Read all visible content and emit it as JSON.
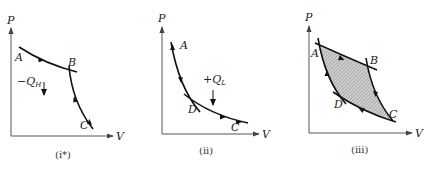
{
  "figure": {
    "panels": [
      {
        "id": "i*",
        "caption": "(i*)",
        "axis_y_label": "P",
        "axis_x_label": "V",
        "points": [
          "A",
          "B",
          "C"
        ],
        "heat_label": "−Q",
        "heat_sub": "H",
        "description": "Isothermal compression A-B (upper) and adiabatic B-C"
      },
      {
        "id": "ii",
        "caption": "(ii)",
        "axis_y_label": "P",
        "axis_x_label": "V",
        "points": [
          "A",
          "D",
          "C"
        ],
        "heat_label": "+Q",
        "heat_sub": "L",
        "description": "Adiabatic A-D and isothermal D-C (lower)"
      },
      {
        "id": "iii",
        "caption": "(iii)",
        "axis_y_label": "P",
        "axis_x_label": "V",
        "points": [
          "A",
          "B",
          "C",
          "D"
        ],
        "description": "Closed Carnot cycle A-B-C-D, shaded enclosed area"
      }
    ],
    "colors": {
      "line": "#111111",
      "axis": "#444444",
      "shade": "#b8b8b8"
    }
  }
}
